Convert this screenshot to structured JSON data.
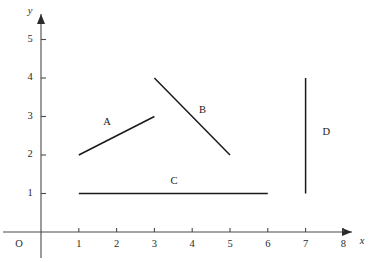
{
  "chart_data": {
    "type": "scatter",
    "title": "",
    "xlabel": "x",
    "ylabel": "y",
    "xlim": [
      0,
      8.6
    ],
    "ylim": [
      0,
      5.6
    ],
    "grid": false,
    "legend": "none",
    "x_ticks": [
      "1",
      "2",
      "3",
      "4",
      "5",
      "6",
      "7",
      "8"
    ],
    "x_tick_values": [
      1,
      2,
      3,
      4,
      5,
      6,
      7,
      8
    ],
    "y_ticks": [
      "1",
      "2",
      "3",
      "4",
      "5"
    ],
    "y_tick_values": [
      1,
      2,
      3,
      4,
      5
    ],
    "origin_label": "O",
    "segments": [
      {
        "label": "A",
        "x1": 1,
        "y1": 2,
        "x2": 3,
        "y2": 3,
        "label_x": 1.75,
        "label_y": 2.85,
        "color": "#1a1a1a"
      },
      {
        "label": "B",
        "x1": 3,
        "y1": 4,
        "x2": 5,
        "y2": 2,
        "label_x": 4.27,
        "label_y": 3.15,
        "color": "#1a1a1a"
      },
      {
        "label": "C",
        "x1": 1,
        "y1": 1,
        "x2": 6,
        "y2": 1,
        "label_x": 3.52,
        "label_y": 1.32,
        "color": "#1a1a1a"
      },
      {
        "label": "D",
        "x1": 7,
        "y1": 1,
        "x2": 7,
        "y2": 4,
        "label_x": 7.55,
        "label_y": 2.58,
        "color": "#1a1a1a"
      }
    ]
  }
}
